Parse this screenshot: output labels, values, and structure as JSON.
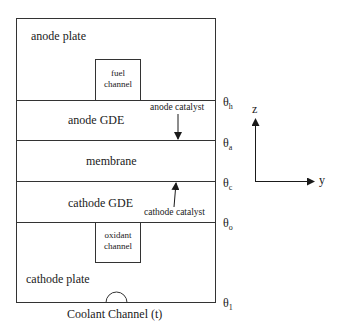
{
  "diagram": {
    "type": "fuel-cell-cross-section",
    "layers": [
      {
        "id": "anode-plate",
        "label": "anode plate"
      },
      {
        "id": "anode-gde",
        "label": "anode GDE"
      },
      {
        "id": "membrane",
        "label": "membrane"
      },
      {
        "id": "cathode-gde",
        "label": "cathode GDE"
      },
      {
        "id": "cathode-plate",
        "label": "cathode plate"
      }
    ],
    "channels": {
      "fuel": {
        "line1": "fuel",
        "line2": "channel"
      },
      "oxidant": {
        "line1": "oxidant",
        "line2": "channel"
      },
      "coolant": {
        "label": "Coolant Channel (t)"
      }
    },
    "annotations": {
      "anode_catalyst": "anode catalyst",
      "cathode_catalyst": "cathode catalyst"
    },
    "boundaries": [
      {
        "symbol": "θ",
        "sub": "h"
      },
      {
        "symbol": "θ",
        "sub": "a"
      },
      {
        "symbol": "θ",
        "sub": "c"
      },
      {
        "symbol": "θ",
        "sub": "o"
      },
      {
        "symbol": "θ",
        "sub": "1"
      }
    ],
    "axes": {
      "vertical": "z",
      "horizontal": "y"
    },
    "colors": {
      "line": "#333333",
      "background": "#ffffff"
    }
  }
}
